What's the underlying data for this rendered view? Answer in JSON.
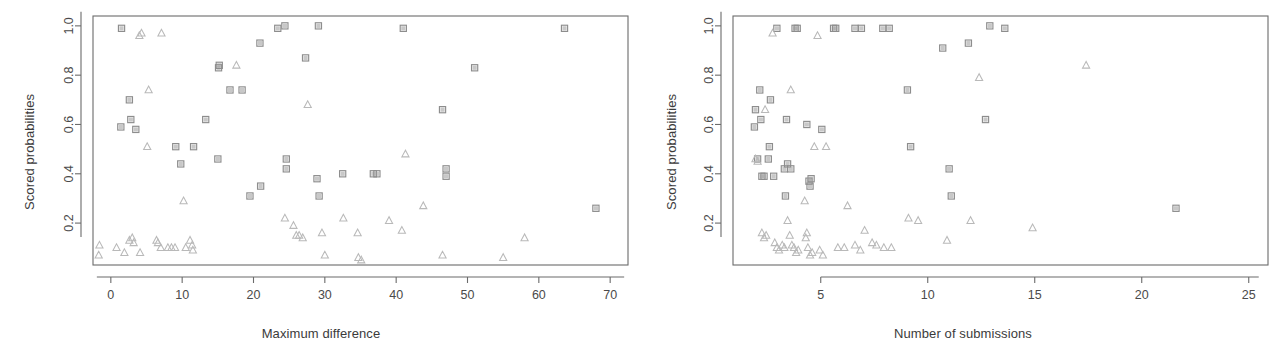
{
  "figure": {
    "background": "#ffffff",
    "panel_count": 2
  },
  "panels": {
    "left": {
      "xlabel": "Maximum difference",
      "ylabel": "Scored probabilities"
    },
    "right": {
      "xlabel": "Number of submissions",
      "ylabel": "Scored probabilities"
    }
  },
  "chart_data": [
    {
      "type": "scatter",
      "title": "",
      "xlabel": "Maximum difference",
      "ylabel": "Scored probabilities",
      "xlim": [
        -2.5,
        72.5
      ],
      "ylim": [
        0.03,
        1.04
      ],
      "xticks": [
        0,
        10,
        20,
        30,
        40,
        50,
        60,
        70
      ],
      "yticks": [
        0.2,
        0.4,
        0.6,
        0.8,
        1.0
      ],
      "xtick_labels": [
        "0",
        "10",
        "20",
        "30",
        "40",
        "50",
        "60",
        "70"
      ],
      "ytick_labels": [
        "0.2",
        "0.4",
        "0.6",
        "0.8",
        "1.0"
      ],
      "grid": false,
      "legend": null,
      "series": [
        {
          "name": "squares",
          "marker": "square",
          "color": "#9a9a9a",
          "points": [
            [
              1.5,
              0.99
            ],
            [
              1.4,
              0.59
            ],
            [
              2.6,
              0.7
            ],
            [
              2.8,
              0.62
            ],
            [
              3.5,
              0.58
            ],
            [
              9.1,
              0.51
            ],
            [
              9.8,
              0.44
            ],
            [
              11.6,
              0.51
            ],
            [
              13.3,
              0.62
            ],
            [
              15.1,
              0.83
            ],
            [
              15.2,
              0.84
            ],
            [
              15.0,
              0.46
            ],
            [
              16.7,
              0.74
            ],
            [
              18.4,
              0.74
            ],
            [
              19.5,
              0.31
            ],
            [
              21.0,
              0.35
            ],
            [
              20.9,
              0.93
            ],
            [
              23.4,
              0.99
            ],
            [
              24.4,
              1.0
            ],
            [
              24.6,
              0.46
            ],
            [
              24.6,
              0.42
            ],
            [
              27.3,
              0.87
            ],
            [
              29.1,
              1.0
            ],
            [
              28.9,
              0.38
            ],
            [
              29.2,
              0.31
            ],
            [
              32.5,
              0.4
            ],
            [
              36.8,
              0.4
            ],
            [
              37.3,
              0.4
            ],
            [
              41.0,
              0.99
            ],
            [
              46.5,
              0.66
            ],
            [
              47.0,
              0.42
            ],
            [
              47.0,
              0.39
            ],
            [
              51.0,
              0.83
            ],
            [
              63.6,
              0.99
            ],
            [
              68.0,
              0.26
            ]
          ]
        },
        {
          "name": "triangles",
          "marker": "triangle",
          "color": "#b9b9b9",
          "points": [
            [
              -1.6,
              0.11
            ],
            [
              -1.7,
              0.07
            ],
            [
              0.8,
              0.1
            ],
            [
              1.9,
              0.08
            ],
            [
              2.6,
              0.13
            ],
            [
              3.0,
              0.14
            ],
            [
              3.2,
              0.12
            ],
            [
              4.1,
              0.08
            ],
            [
              4.0,
              0.96
            ],
            [
              4.3,
              0.97
            ],
            [
              5.1,
              0.51
            ],
            [
              5.3,
              0.74
            ],
            [
              6.4,
              0.13
            ],
            [
              6.6,
              0.12
            ],
            [
              7.0,
              0.1
            ],
            [
              7.1,
              0.97
            ],
            [
              8.0,
              0.1
            ],
            [
              8.5,
              0.1
            ],
            [
              9.0,
              0.1
            ],
            [
              10.2,
              0.29
            ],
            [
              10.5,
              0.1
            ],
            [
              11.1,
              0.13
            ],
            [
              11.4,
              0.11
            ],
            [
              11.5,
              0.09
            ],
            [
              17.6,
              0.84
            ],
            [
              24.4,
              0.22
            ],
            [
              25.6,
              0.19
            ],
            [
              26.0,
              0.15
            ],
            [
              26.4,
              0.15
            ],
            [
              26.9,
              0.14
            ],
            [
              27.6,
              0.68
            ],
            [
              29.6,
              0.16
            ],
            [
              30.0,
              0.07
            ],
            [
              32.6,
              0.22
            ],
            [
              34.6,
              0.16
            ],
            [
              34.7,
              0.06
            ],
            [
              35.1,
              0.05
            ],
            [
              39.0,
              0.21
            ],
            [
              40.8,
              0.17
            ],
            [
              41.3,
              0.48
            ],
            [
              43.8,
              0.27
            ],
            [
              46.5,
              0.07
            ],
            [
              55.0,
              0.06
            ],
            [
              58.0,
              0.14
            ]
          ]
        }
      ]
    },
    {
      "type": "scatter",
      "title": "",
      "xlabel": "Number of submissions",
      "ylabel": "Scored probabilities",
      "xlim": [
        0.9,
        25.9
      ],
      "ylim": [
        0.03,
        1.04
      ],
      "xticks": [
        5,
        10,
        15,
        20,
        25
      ],
      "yticks": [
        0.2,
        0.4,
        0.6,
        0.8,
        1.0
      ],
      "xtick_labels": [
        "5",
        "10",
        "15",
        "20",
        "25"
      ],
      "ytick_labels": [
        "0.2",
        "0.4",
        "0.6",
        "0.8",
        "1.0"
      ],
      "grid": false,
      "legend": null,
      "series": [
        {
          "name": "squares",
          "marker": "square",
          "color": "#9a9a9a",
          "points": [
            [
              1.95,
              0.66
            ],
            [
              1.9,
              0.59
            ],
            [
              2.05,
              0.46
            ],
            [
              2.15,
              0.74
            ],
            [
              2.2,
              0.62
            ],
            [
              2.25,
              0.39
            ],
            [
              2.35,
              0.39
            ],
            [
              2.55,
              0.46
            ],
            [
              2.65,
              0.7
            ],
            [
              2.6,
              0.51
            ],
            [
              2.8,
              0.39
            ],
            [
              2.95,
              0.99
            ],
            [
              3.3,
              0.42
            ],
            [
              3.45,
              0.44
            ],
            [
              3.4,
              0.62
            ],
            [
              3.35,
              0.31
            ],
            [
              3.6,
              0.42
            ],
            [
              3.8,
              0.99
            ],
            [
              3.9,
              0.99
            ],
            [
              4.35,
              0.6
            ],
            [
              4.45,
              0.37
            ],
            [
              4.5,
              0.35
            ],
            [
              4.55,
              0.38
            ],
            [
              5.05,
              0.58
            ],
            [
              5.6,
              0.99
            ],
            [
              5.7,
              0.99
            ],
            [
              6.6,
              0.99
            ],
            [
              6.9,
              0.99
            ],
            [
              7.9,
              0.99
            ],
            [
              8.2,
              0.99
            ],
            [
              9.05,
              0.74
            ],
            [
              9.2,
              0.51
            ],
            [
              10.7,
              0.91
            ],
            [
              11.0,
              0.42
            ],
            [
              11.1,
              0.31
            ],
            [
              11.9,
              0.93
            ],
            [
              12.7,
              0.62
            ],
            [
              12.9,
              1.0
            ],
            [
              13.6,
              0.99
            ],
            [
              21.6,
              0.26
            ]
          ]
        },
        {
          "name": "triangles",
          "marker": "triangle",
          "color": "#b9b9b9",
          "points": [
            [
              1.95,
              0.46
            ],
            [
              2.05,
              0.45
            ],
            [
              2.25,
              0.16
            ],
            [
              2.35,
              0.14
            ],
            [
              2.45,
              0.15
            ],
            [
              2.4,
              0.66
            ],
            [
              2.75,
              0.97
            ],
            [
              2.85,
              0.12
            ],
            [
              2.95,
              0.1
            ],
            [
              3.05,
              0.09
            ],
            [
              3.2,
              0.11
            ],
            [
              3.3,
              0.1
            ],
            [
              3.45,
              0.21
            ],
            [
              3.55,
              0.15
            ],
            [
              3.6,
              0.74
            ],
            [
              3.65,
              0.11
            ],
            [
              3.75,
              0.1
            ],
            [
              3.85,
              0.08
            ],
            [
              3.95,
              0.09
            ],
            [
              4.25,
              0.29
            ],
            [
              4.3,
              0.14
            ],
            [
              4.35,
              0.16
            ],
            [
              4.4,
              0.1
            ],
            [
              4.5,
              0.07
            ],
            [
              4.6,
              0.08
            ],
            [
              4.7,
              0.51
            ],
            [
              4.85,
              0.96
            ],
            [
              4.95,
              0.09
            ],
            [
              5.1,
              0.07
            ],
            [
              5.25,
              0.51
            ],
            [
              5.8,
              0.1
            ],
            [
              6.1,
              0.1
            ],
            [
              6.25,
              0.27
            ],
            [
              6.6,
              0.11
            ],
            [
              6.85,
              0.09
            ],
            [
              7.05,
              0.17
            ],
            [
              7.4,
              0.12
            ],
            [
              7.6,
              0.11
            ],
            [
              7.95,
              0.1
            ],
            [
              8.3,
              0.1
            ],
            [
              9.1,
              0.22
            ],
            [
              9.55,
              0.21
            ],
            [
              10.9,
              0.13
            ],
            [
              12.0,
              0.21
            ],
            [
              12.4,
              0.79
            ],
            [
              14.9,
              0.18
            ],
            [
              17.4,
              0.84
            ]
          ]
        }
      ]
    }
  ]
}
